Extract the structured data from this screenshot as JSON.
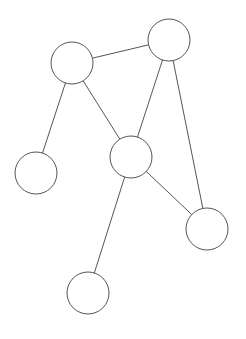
{
  "diagram": {
    "background_color": "#ffffff",
    "stroke_color": "#55555a",
    "node_fill_color": "#ffffff",
    "stroke_width": 1,
    "width": 246,
    "height": 339,
    "node_count": 6,
    "edge_count": 7
  },
  "chart_data": {
    "type": "diagram",
    "nodes": [
      {
        "id": "n1",
        "label": "",
        "cx": 72,
        "cy": 63,
        "r": 21,
        "degree": 3
      },
      {
        "id": "n2",
        "label": "",
        "cx": 169,
        "cy": 40,
        "r": 21,
        "degree": 3
      },
      {
        "id": "n3",
        "label": "",
        "cx": 131,
        "cy": 157,
        "r": 21,
        "degree": 4
      },
      {
        "id": "n4",
        "label": "",
        "cx": 36,
        "cy": 173,
        "r": 21,
        "degree": 1
      },
      {
        "id": "n5",
        "label": "",
        "cx": 207,
        "cy": 229,
        "r": 21,
        "degree": 2
      },
      {
        "id": "n6",
        "label": "",
        "cx": 88,
        "cy": 293,
        "r": 21,
        "degree": 1
      }
    ],
    "edges": [
      {
        "id": "e1",
        "source": "n1",
        "target": "n2"
      },
      {
        "id": "e2",
        "source": "n1",
        "target": "n3"
      },
      {
        "id": "e3",
        "source": "n1",
        "target": "n4"
      },
      {
        "id": "e4",
        "source": "n2",
        "target": "n3"
      },
      {
        "id": "e5",
        "source": "n2",
        "target": "n5"
      },
      {
        "id": "e6",
        "source": "n3",
        "target": "n5"
      },
      {
        "id": "e7",
        "source": "n3",
        "target": "n6"
      }
    ]
  }
}
